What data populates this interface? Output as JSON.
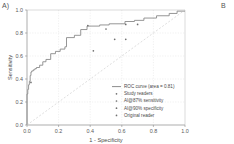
{
  "figure": {
    "panel_a_label": "A)",
    "panel_b_label": "B"
  },
  "axes": {
    "xlabel": "1 - Specificity",
    "ylabel": "Sensitivity",
    "xticks": [
      "0.0",
      "0.2",
      "0.4",
      "0.6",
      "0.8",
      "1.0"
    ],
    "yticks": [
      "0.0",
      "0.2",
      "0.4",
      "0.6",
      "0.8",
      "1.0"
    ],
    "xlim": [
      0.0,
      1.0
    ],
    "ylim": [
      0.0,
      1.0
    ],
    "grid": true
  },
  "legend": {
    "position": "lower-right",
    "entries": [
      {
        "label": "ROC curve (area = 0.81)",
        "marker": "line",
        "color": "#808080"
      },
      {
        "label": "Study readers",
        "marker": "point",
        "color": "#707070"
      },
      {
        "label": "AI@87% sensitivity",
        "marker": "point",
        "color": "#707070"
      },
      {
        "label": "AI@90% specificity",
        "marker": "point",
        "color": "#707070"
      },
      {
        "label": "Original reader",
        "marker": "point",
        "color": "#707070"
      }
    ]
  },
  "chart_data": {
    "type": "line",
    "title": "",
    "xlabel": "1 - Specificity",
    "ylabel": "Sensitivity",
    "xlim": [
      0.0,
      1.0
    ],
    "ylim": [
      0.0,
      1.0
    ],
    "grid": true,
    "auc": 0.81,
    "series": [
      {
        "name": "ROC curve (area = 0.81)",
        "type": "step",
        "color": "#8a8a8a",
        "x": [
          0.0,
          0.0,
          0.005,
          0.005,
          0.01,
          0.01,
          0.015,
          0.015,
          0.02,
          0.02,
          0.025,
          0.025,
          0.03,
          0.03,
          0.04,
          0.04,
          0.05,
          0.05,
          0.06,
          0.06,
          0.08,
          0.08,
          0.1,
          0.1,
          0.12,
          0.12,
          0.15,
          0.15,
          0.18,
          0.18,
          0.21,
          0.21,
          0.24,
          0.24,
          0.25,
          0.25,
          0.3,
          0.3,
          0.34,
          0.34,
          0.38,
          0.38,
          0.46,
          0.46,
          0.52,
          0.52,
          0.62,
          0.62,
          0.68,
          0.68,
          0.74,
          0.74,
          0.82,
          0.82,
          0.9,
          0.9,
          0.95,
          0.95,
          1.0
        ],
        "y": [
          0.0,
          0.27,
          0.27,
          0.31,
          0.31,
          0.35,
          0.35,
          0.38,
          0.38,
          0.43,
          0.43,
          0.46,
          0.46,
          0.47,
          0.47,
          0.48,
          0.48,
          0.49,
          0.49,
          0.5,
          0.5,
          0.52,
          0.52,
          0.55,
          0.55,
          0.57,
          0.57,
          0.62,
          0.62,
          0.64,
          0.64,
          0.66,
          0.66,
          0.68,
          0.68,
          0.76,
          0.76,
          0.78,
          0.78,
          0.83,
          0.83,
          0.86,
          0.86,
          0.87,
          0.87,
          0.88,
          0.88,
          0.9,
          0.9,
          0.91,
          0.91,
          0.93,
          0.93,
          0.95,
          0.95,
          0.97,
          0.97,
          0.99,
          0.99
        ]
      },
      {
        "name": "Chance line",
        "type": "diagonal",
        "color": "#c8c8c8",
        "x": [
          0.0,
          1.0
        ],
        "y": [
          0.0,
          1.0
        ]
      }
    ],
    "points": [
      {
        "group": "Study readers",
        "x": 0.42,
        "y": 0.645,
        "marker": "point"
      },
      {
        "group": "Study readers",
        "x": 0.5,
        "y": 0.835,
        "marker": "point"
      },
      {
        "group": "Study readers",
        "x": 0.555,
        "y": 0.745,
        "marker": "point"
      },
      {
        "group": "Study readers",
        "x": 0.625,
        "y": 0.745,
        "marker": "point"
      },
      {
        "group": "AI@87% sensitivity",
        "x": 0.625,
        "y": 0.875,
        "marker": "point"
      },
      {
        "group": "AI@90% specificity",
        "x": 0.7,
        "y": 0.875,
        "marker": "point"
      },
      {
        "group": "Original reader",
        "x": 0.385,
        "y": 0.865,
        "marker": "point"
      },
      {
        "group": "Original reader",
        "x": 0.025,
        "y": 0.37,
        "marker": "point"
      }
    ]
  }
}
